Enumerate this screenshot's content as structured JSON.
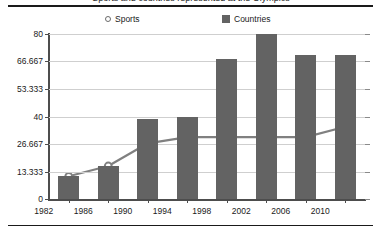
{
  "caption": "Sports and countries represented at the Olympics",
  "legend": {
    "position": "top",
    "items": [
      {
        "label": "Sports",
        "marker": "open-circle-icon",
        "color": "#6b6b6b"
      },
      {
        "label": "Countries",
        "marker": "filled-square-icon",
        "color": "#636363"
      }
    ]
  },
  "axes": {
    "y_ticks": [
      "0",
      "13.333",
      "26.667",
      "40",
      "53.333",
      "66.667",
      "80"
    ],
    "x_ticks": [
      "1982",
      "1986",
      "1990",
      "1994",
      "1998",
      "2002",
      "2006",
      "2010"
    ]
  },
  "chart_data": {
    "type": "bar",
    "title": "Sports and countries represented at the Olympics",
    "xlabel": "",
    "ylabel": "",
    "categories": [
      "1982",
      "1986",
      "1990",
      "1994",
      "1998",
      "2002",
      "2006",
      "2010"
    ],
    "series": [
      {
        "name": "Countries",
        "type": "bar",
        "color": "#636363",
        "values": [
          11,
          16,
          39,
          40,
          68,
          80,
          70,
          70
        ]
      },
      {
        "name": "Sports",
        "type": "line",
        "color": "#808080",
        "marker": "open-circle",
        "values": [
          11,
          16,
          27,
          30,
          30,
          30,
          30,
          35
        ]
      }
    ],
    "ylim": [
      0,
      80
    ],
    "ytick_values": [
      0,
      13.333,
      26.667,
      40,
      53.333,
      66.667,
      80
    ],
    "grid": true,
    "legend_position": "top"
  }
}
